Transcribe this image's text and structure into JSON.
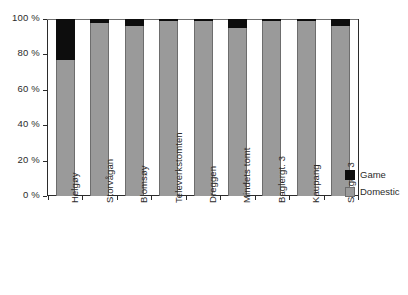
{
  "chart_data": {
    "type": "bar",
    "subtype": "stacked-percentage",
    "title": "",
    "subtitle": "",
    "xlabel": "",
    "ylabel": "",
    "ylim": [
      0,
      100
    ],
    "yticks": [
      0,
      20,
      40,
      60,
      80,
      100
    ],
    "ytick_labels": [
      "0 %",
      "20 %",
      "40 %",
      "60 %",
      "80 %",
      "100 %"
    ],
    "grid": false,
    "legend_position": "right",
    "categories": [
      "Helgøy",
      "Storvågan",
      "Blomsøy",
      "Televerkstomten",
      "Dreggen",
      "Mindets tomt",
      "Baglergt. 3",
      "Kaupang",
      "Skagen 3"
    ],
    "series": [
      {
        "name": "Domestic",
        "color": "#9a9a9a",
        "values": [
          77,
          98,
          96,
          99,
          99,
          95,
          99,
          99,
          96
        ]
      },
      {
        "name": "Game",
        "color": "#0d0d0d",
        "values": [
          23,
          2,
          4,
          1,
          1,
          5,
          1,
          1,
          4
        ]
      }
    ]
  },
  "legend": {
    "items": [
      {
        "label": "Game",
        "color": "#0d0d0d",
        "swatch": "game"
      },
      {
        "label": "Domestic",
        "color": "#9a9a9a",
        "swatch": "domestic"
      }
    ]
  },
  "axis": {
    "y_labels": [
      "100 %",
      "80 %",
      "60 %",
      "40 %",
      "20 %",
      "0 %"
    ],
    "x_labels": [
      "Helgøy",
      "Storvågan",
      "Blomsøy",
      "Televerkstomten",
      "Dreggen",
      "Mindets tomt",
      "Baglergt. 3",
      "Kaupang",
      "Skagen 3"
    ]
  },
  "caption": {
    "text": ""
  }
}
